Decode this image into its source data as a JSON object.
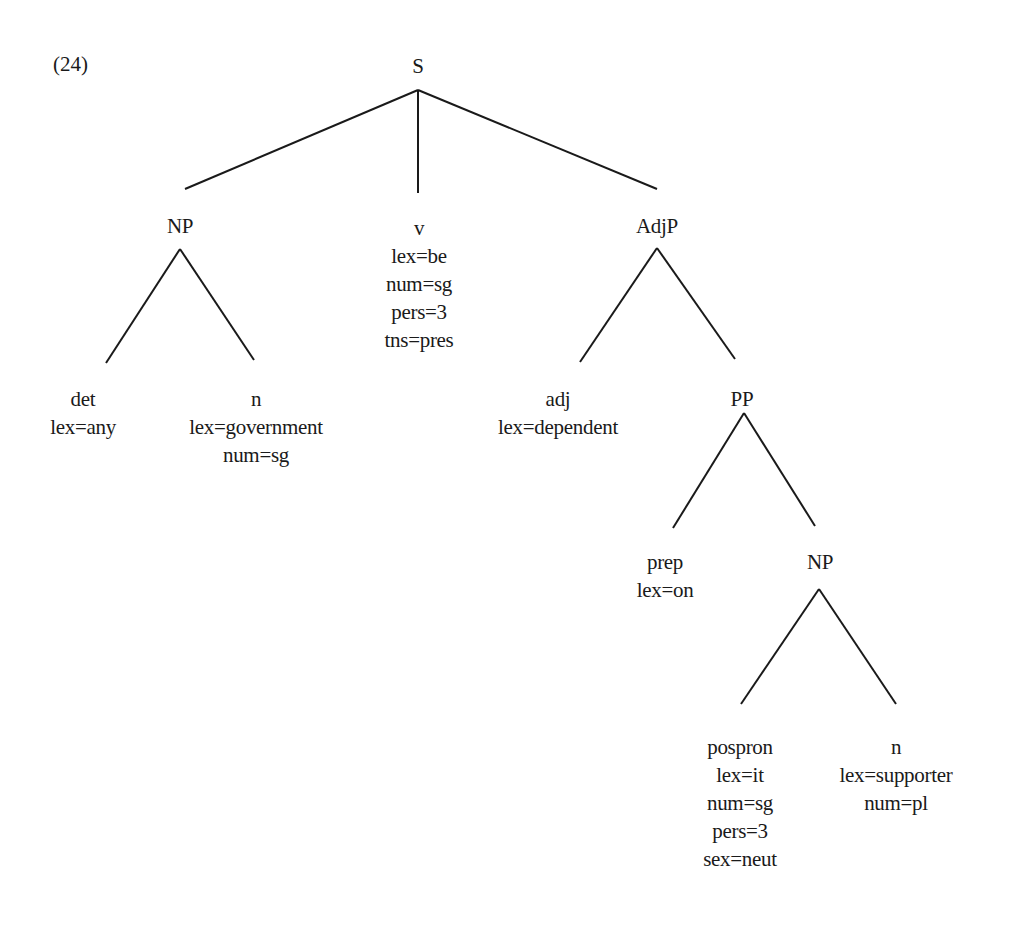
{
  "example_number": "(24)",
  "tree": {
    "line_color": "#1a1a1a",
    "nodes": [
      {
        "id": "S",
        "label": "S",
        "features": [],
        "x": 418,
        "y": 52
      },
      {
        "id": "NP1",
        "label": "NP",
        "features": [],
        "x": 180,
        "y": 212
      },
      {
        "id": "v",
        "label": "v",
        "features": [
          "lex=be",
          "num=sg",
          "pers=3",
          "tns=pres"
        ],
        "x": 419,
        "y": 214
      },
      {
        "id": "AdjP",
        "label": "AdjP",
        "features": [],
        "x": 657,
        "y": 212
      },
      {
        "id": "det",
        "label": "det",
        "features": [
          "lex=any"
        ],
        "x": 83,
        "y": 385
      },
      {
        "id": "n1",
        "label": "n",
        "features": [
          "lex=government",
          "num=sg"
        ],
        "x": 256,
        "y": 385
      },
      {
        "id": "adj",
        "label": "adj",
        "features": [
          "lex=dependent"
        ],
        "x": 558,
        "y": 385
      },
      {
        "id": "PP",
        "label": "PP",
        "features": [],
        "x": 742,
        "y": 385
      },
      {
        "id": "prep",
        "label": "prep",
        "features": [
          "lex=on"
        ],
        "x": 665,
        "y": 548
      },
      {
        "id": "NP2",
        "label": "NP",
        "features": [],
        "x": 820,
        "y": 548
      },
      {
        "id": "pospron",
        "label": "pospron",
        "features": [
          "lex=it",
          "num=sg",
          "pers=3",
          "sex=neut"
        ],
        "x": 740,
        "y": 733
      },
      {
        "id": "n2",
        "label": "n",
        "features": [
          "lex=supporter",
          "num=pl"
        ],
        "x": 896,
        "y": 733
      }
    ],
    "edges": [
      {
        "from": "S",
        "to": "NP1",
        "x1": 418,
        "y1": 90,
        "x2": 185,
        "y2": 189
      },
      {
        "from": "S",
        "to": "v",
        "x1": 418,
        "y1": 90,
        "x2": 418,
        "y2": 193
      },
      {
        "from": "S",
        "to": "AdjP",
        "x1": 418,
        "y1": 90,
        "x2": 657,
        "y2": 189
      },
      {
        "from": "NP1",
        "to": "det",
        "x1": 180,
        "y1": 249,
        "x2": 106,
        "y2": 363
      },
      {
        "from": "NP1",
        "to": "n1",
        "x1": 180,
        "y1": 249,
        "x2": 254,
        "y2": 360
      },
      {
        "from": "AdjP",
        "to": "adj",
        "x1": 657,
        "y1": 248,
        "x2": 580,
        "y2": 362
      },
      {
        "from": "AdjP",
        "to": "PP",
        "x1": 657,
        "y1": 248,
        "x2": 735,
        "y2": 359
      },
      {
        "from": "PP",
        "to": "prep",
        "x1": 744,
        "y1": 413,
        "x2": 673,
        "y2": 528
      },
      {
        "from": "PP",
        "to": "NP2",
        "x1": 744,
        "y1": 413,
        "x2": 815,
        "y2": 526
      },
      {
        "from": "NP2",
        "to": "pospron",
        "x1": 819,
        "y1": 589,
        "x2": 741,
        "y2": 704
      },
      {
        "from": "NP2",
        "to": "n2",
        "x1": 819,
        "y1": 589,
        "x2": 896,
        "y2": 704
      }
    ]
  }
}
